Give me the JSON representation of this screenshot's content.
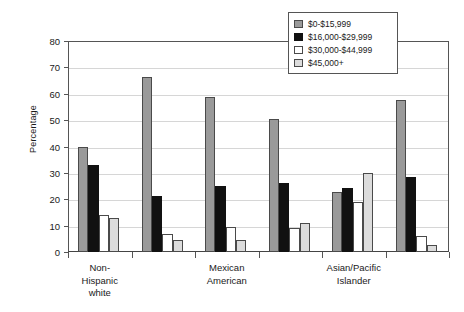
{
  "chart_data": {
    "type": "bar",
    "title": "",
    "xlabel": "",
    "ylabel": "Percentage",
    "ylim": [
      0,
      80
    ],
    "yticks": [
      0,
      10,
      20,
      30,
      40,
      50,
      60,
      70,
      80
    ],
    "ytick_labels": [
      "0",
      "10",
      "20",
      "30",
      "40",
      "50",
      "60",
      "70",
      "80"
    ],
    "grid": true,
    "legend_position": "top-right",
    "categories": [
      "Non-Hispanic white",
      "",
      "Mexican American",
      "",
      "Asian/Pacific Islander",
      ""
    ],
    "visible_category_labels": [
      {
        "line1": "Non-",
        "line2": "Hispanic",
        "line3": "white"
      },
      {
        "line1": "Mexican",
        "line2": "American",
        "line3": ""
      },
      {
        "line1": "Asian/Pacific",
        "line2": "Islander",
        "line3": ""
      }
    ],
    "series": [
      {
        "name": "$0-$15,999",
        "color": "#9a9a9a",
        "values": [
          39.8,
          66.3,
          58.6,
          50.5,
          22.6,
          57.6
        ]
      },
      {
        "name": "$16,000-$29,999",
        "color": "#111111",
        "values": [
          33.0,
          21.2,
          25.0,
          26.0,
          24.1,
          28.4
        ]
      },
      {
        "name": "$30,000-$44,999",
        "color": "#ffffff",
        "values": [
          14.1,
          7.0,
          9.6,
          9.2,
          18.8,
          6.2
        ]
      },
      {
        "name": "$45,000+",
        "color": "#dcdcdc",
        "values": [
          12.9,
          4.7,
          4.4,
          10.9,
          30.0,
          2.6
        ]
      }
    ]
  },
  "legend": {
    "items": [
      {
        "label": "$0-$15,999"
      },
      {
        "label": "$16,000-$29,999"
      },
      {
        "label": "$30,000-$44,999"
      },
      {
        "label": "$45,000+"
      }
    ]
  }
}
